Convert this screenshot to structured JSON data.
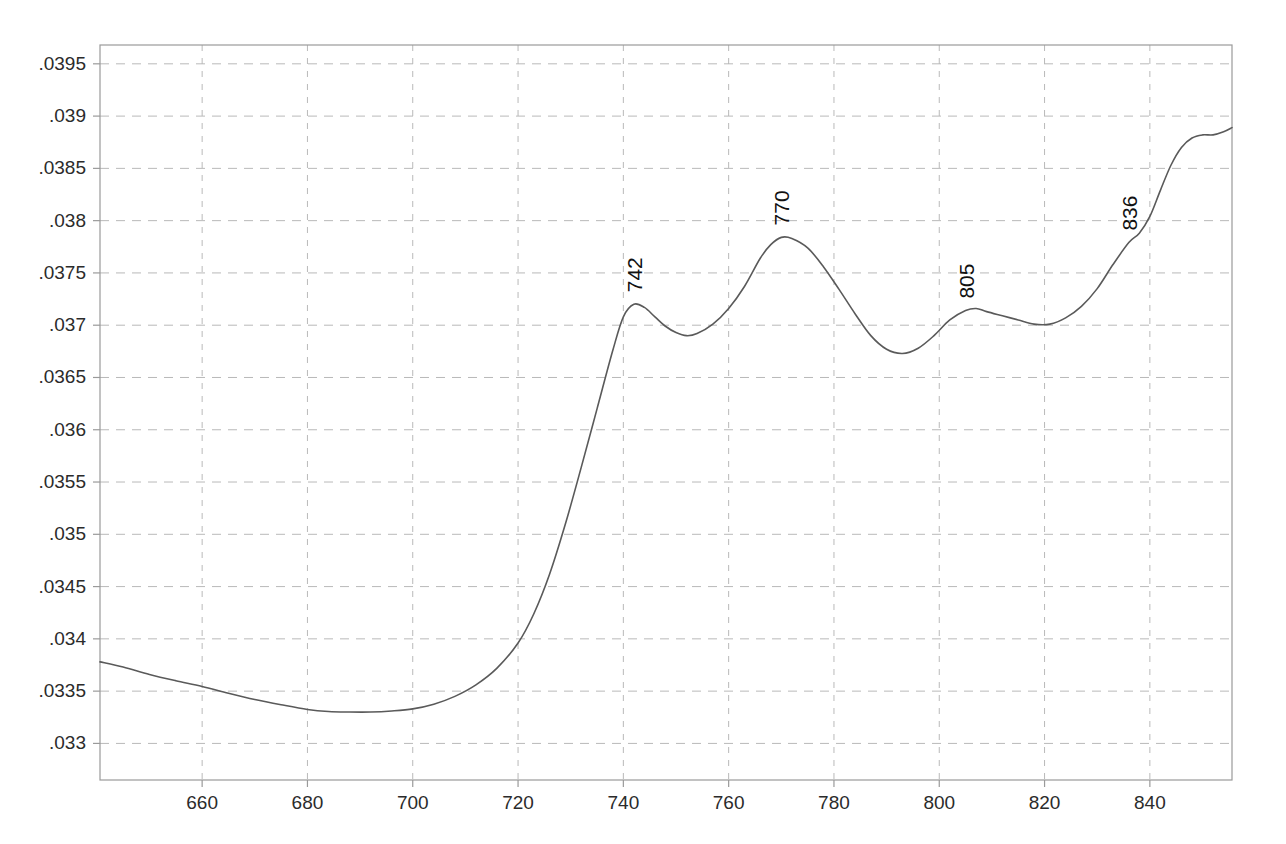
{
  "chart_data": {
    "type": "line",
    "title": "",
    "subtitle": "",
    "xlabel": "",
    "ylabel": "",
    "xlim": [
      640.6,
      855.6
    ],
    "ylim": [
      0.03265,
      0.03968
    ],
    "grid": true,
    "legend": null,
    "legend_position": "none",
    "x_ticks": [
      660,
      680,
      700,
      720,
      740,
      760,
      780,
      800,
      820,
      840
    ],
    "x_tick_labels": [
      "660",
      "680",
      "700",
      "720",
      "740",
      "760",
      "780",
      "800",
      "820",
      "840"
    ],
    "y_ticks": [
      0.033,
      0.0335,
      0.034,
      0.0345,
      0.035,
      0.0355,
      0.036,
      0.0365,
      0.037,
      0.0375,
      0.038,
      0.0385,
      0.039,
      0.0395
    ],
    "y_tick_labels": [
      ".033",
      ".0335",
      ".034",
      ".0345",
      ".035",
      ".0355",
      ".036",
      ".0365",
      ".037",
      ".0375",
      ".038",
      ".0385",
      ".039",
      ".0395"
    ],
    "series": [
      {
        "name": "spectrum",
        "color": "#5a5a5a",
        "x": [
          640.6,
          645,
          650,
          655,
          660,
          665,
          670,
          675,
          680,
          684,
          688,
          692,
          696,
          700,
          704,
          708,
          712,
          716,
          720,
          723,
          726,
          729,
          732,
          735,
          738,
          740,
          742,
          744,
          746,
          748,
          750,
          752,
          754,
          757,
          760,
          763,
          766,
          768,
          770,
          772,
          775,
          778,
          781,
          784,
          787,
          790,
          793,
          796,
          799,
          802,
          805,
          807,
          809,
          812,
          815,
          818,
          821,
          824,
          827,
          830,
          833,
          836,
          838,
          840,
          842,
          844,
          846,
          848,
          850,
          852,
          854,
          855.6
        ],
        "y": [
          0.03378,
          0.03373,
          0.03366,
          0.0336,
          0.033545,
          0.03348,
          0.03342,
          0.03337,
          0.033325,
          0.033305,
          0.0333,
          0.0333,
          0.03331,
          0.03333,
          0.033375,
          0.03345,
          0.03356,
          0.03372,
          0.03396,
          0.03424,
          0.03462,
          0.0351,
          0.03564,
          0.0362,
          0.03676,
          0.03708,
          0.0372,
          0.03717,
          0.03708,
          0.03699,
          0.03693,
          0.0369,
          0.03692,
          0.03701,
          0.03716,
          0.03737,
          0.03764,
          0.03777,
          0.03784,
          0.03783,
          0.03774,
          0.03756,
          0.03734,
          0.03711,
          0.0369,
          0.03677,
          0.03673,
          0.03678,
          0.0369,
          0.03705,
          0.03714,
          0.03716,
          0.03713,
          0.03709,
          0.03705,
          0.03701,
          0.03701,
          0.03707,
          0.03718,
          0.03735,
          0.03758,
          0.03779,
          0.03788,
          0.03804,
          0.03829,
          0.03853,
          0.0387,
          0.03879,
          0.03882,
          0.03882,
          0.03885,
          0.03889
        ]
      }
    ],
    "annotations": [
      {
        "text": "742",
        "x": 742,
        "y": 0.0372,
        "rotation": -90
      },
      {
        "text": "770",
        "x": 770,
        "y": 0.03784,
        "rotation": -90
      },
      {
        "text": "805",
        "x": 805,
        "y": 0.03714,
        "rotation": -90
      },
      {
        "text": "836",
        "x": 836,
        "y": 0.03779,
        "rotation": -90
      }
    ]
  },
  "style": {
    "background": "#ffffff",
    "series_color": "#5a5a5a",
    "grid_color": "#b9b9b9",
    "frame_color": "#9a9a9a",
    "label_color": "#2b2b2b"
  }
}
